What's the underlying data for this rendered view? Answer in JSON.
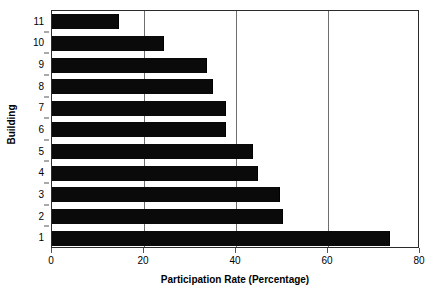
{
  "chart_data": {
    "type": "bar",
    "orientation": "horizontal",
    "title": "",
    "xlabel": "Participation Rate (Percentage)",
    "ylabel": "Building",
    "categories": [
      "11",
      "10",
      "9",
      "8",
      "7",
      "6",
      "5",
      "4",
      "3",
      "2",
      "1"
    ],
    "values": [
      14.4,
      24.2,
      33.5,
      34.8,
      37.6,
      37.6,
      43.5,
      44.6,
      49.4,
      50.0,
      73.3
    ],
    "xlim": [
      0,
      80
    ],
    "xticks": [
      0,
      20,
      40,
      60,
      80
    ],
    "xtick_labels": [
      "0",
      "20",
      "40",
      "60",
      "80"
    ],
    "yticks": [
      "11",
      "10",
      "9",
      "8",
      "7",
      "6",
      "5",
      "4",
      "3",
      "2",
      "1"
    ],
    "gridlines": {
      "vertical_at": [
        20,
        40,
        60
      ],
      "horizontal": false
    },
    "legend": null,
    "bar_color": "#0a0a0a",
    "background_color": "#ffffff",
    "axis_color": "#2b2b2b",
    "grid_color": "#6e6e6e"
  }
}
